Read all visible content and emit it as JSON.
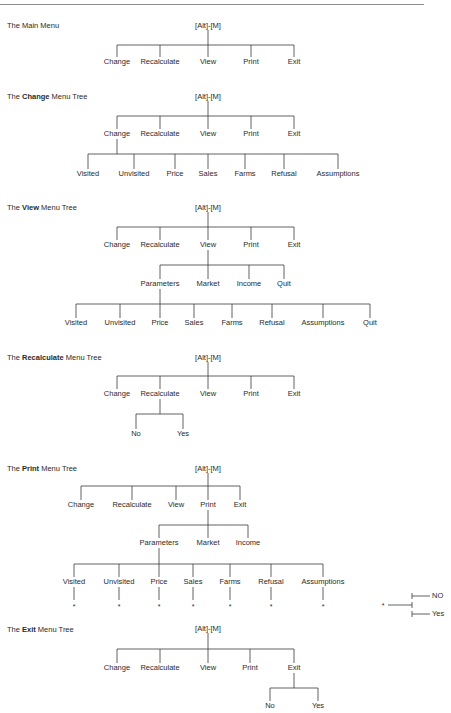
{
  "root_label": "[Alt]-[M]",
  "trees": [
    {
      "id": "main",
      "title_prefix": "The ",
      "title_bold": "",
      "title_plain": "Main Menu",
      "title_y": 26,
      "root": {
        "x": 208,
        "y": 26
      },
      "levels": [
        {
          "bar_y": 45,
          "label_y": 62,
          "parent_x": 208,
          "parent_y": 30,
          "items": [
            {
              "label": "Change",
              "x": 117
            },
            {
              "label": "Recalculate",
              "x": 160
            },
            {
              "label": "View",
              "x": 208
            },
            {
              "label": "Print",
              "x": 251
            },
            {
              "label": "Exit",
              "x": 294
            }
          ]
        }
      ]
    },
    {
      "id": "change",
      "title_prefix": "The ",
      "title_bold": "Change",
      "title_plain": " Menu Tree",
      "title_y": 97,
      "root": {
        "x": 208,
        "y": 97
      },
      "levels": [
        {
          "bar_y": 116,
          "label_y": 134,
          "parent_x": 208,
          "parent_y": 101,
          "items": [
            {
              "label": "Change",
              "x": 117
            },
            {
              "label": "Recalculate",
              "x": 160
            },
            {
              "label": "View",
              "x": 208
            },
            {
              "label": "Print",
              "x": 251
            },
            {
              "label": "Exit",
              "x": 294
            }
          ]
        },
        {
          "bar_y": 154,
          "label_y": 174,
          "parent_x": 117,
          "parent_y": 139,
          "items": [
            {
              "label": "Visited",
              "x": 88
            },
            {
              "label": "Unvisited",
              "x": 134
            },
            {
              "label": "Price",
              "x": 175
            },
            {
              "label": "Sales",
              "x": 208
            },
            {
              "label": "Farms",
              "x": 245
            },
            {
              "label": "Refusal",
              "x": 284
            },
            {
              "label": "Assumptions",
              "x": 338
            }
          ]
        }
      ]
    },
    {
      "id": "view",
      "title_prefix": "The ",
      "title_bold": "View",
      "title_plain": " Menu Tree",
      "title_y": 208,
      "root": {
        "x": 208,
        "y": 208
      },
      "levels": [
        {
          "bar_y": 227,
          "label_y": 245,
          "parent_x": 208,
          "parent_y": 212,
          "items": [
            {
              "label": "Change",
              "x": 117
            },
            {
              "label": "Recalculate",
              "x": 160
            },
            {
              "label": "View",
              "x": 208
            },
            {
              "label": "Print",
              "x": 251
            },
            {
              "label": "Exit",
              "x": 294
            }
          ]
        },
        {
          "bar_y": 265,
          "label_y": 284,
          "parent_x": 208,
          "parent_y": 250,
          "items": [
            {
              "label": "Parameters",
              "x": 160
            },
            {
              "label": "Market",
              "x": 208
            },
            {
              "label": "Income",
              "x": 249
            },
            {
              "label": "Quit",
              "x": 284
            }
          ]
        },
        {
          "bar_y": 304,
          "label_y": 323,
          "parent_x": 160,
          "parent_y": 289,
          "items": [
            {
              "label": "Visited",
              "x": 76
            },
            {
              "label": "Unvisited",
              "x": 120
            },
            {
              "label": "Price",
              "x": 160
            },
            {
              "label": "Sales",
              "x": 194
            },
            {
              "label": "Farms",
              "x": 232
            },
            {
              "label": "Refusal",
              "x": 272
            },
            {
              "label": "Assumptions",
              "x": 323
            },
            {
              "label": "Quit",
              "x": 370
            }
          ]
        }
      ]
    },
    {
      "id": "recalculate",
      "title_prefix": "The ",
      "title_bold": "Recalculate",
      "title_plain": " Menu Tree",
      "title_y": 358,
      "root": {
        "x": 208,
        "y": 358
      },
      "levels": [
        {
          "bar_y": 376,
          "label_y": 394,
          "parent_x": 208,
          "parent_y": 362,
          "items": [
            {
              "label": "Change",
              "x": 117
            },
            {
              "label": "Recalculate",
              "x": 160
            },
            {
              "label": "View",
              "x": 208
            },
            {
              "label": "Print",
              "x": 251
            },
            {
              "label": "Exit",
              "x": 294
            }
          ]
        },
        {
          "bar_y": 414,
          "label_y": 434,
          "parent_x": 160,
          "parent_y": 399,
          "items": [
            {
              "label": "No",
              "x": 136
            },
            {
              "label": "Yes",
              "x": 183
            }
          ]
        }
      ]
    },
    {
      "id": "print",
      "title_prefix": "The ",
      "title_bold": "Print",
      "title_plain": " Menu Tree",
      "title_y": 469,
      "root": {
        "x": 208,
        "y": 469
      },
      "levels": [
        {
          "bar_y": 486,
          "label_y": 505,
          "parent_x": 208,
          "parent_y": 473,
          "items": [
            {
              "label": "Change",
              "x": 81
            },
            {
              "label": "Recalculate",
              "x": 132
            },
            {
              "label": "View",
              "x": 176
            },
            {
              "label": "Print",
              "x": 208
            },
            {
              "label": "Exit",
              "x": 240
            }
          ]
        },
        {
          "bar_y": 525,
          "label_y": 543,
          "parent_x": 208,
          "parent_y": 510,
          "items": [
            {
              "label": "Parameters",
              "x": 159
            },
            {
              "label": "Market",
              "x": 208
            },
            {
              "label": "Income",
              "x": 248
            }
          ]
        },
        {
          "bar_y": 564,
          "label_y": 582,
          "parent_x": 159,
          "parent_y": 548,
          "items": [
            {
              "label": "Visited",
              "x": 74
            },
            {
              "label": "Unvisited",
              "x": 119
            },
            {
              "label": "Price",
              "x": 159
            },
            {
              "label": "Sales",
              "x": 193
            },
            {
              "label": "Farms",
              "x": 230
            },
            {
              "label": "Refusal",
              "x": 271
            },
            {
              "label": "Assumptions",
              "x": 323
            }
          ]
        }
      ],
      "stars": {
        "symbol": "*",
        "line_top": 587,
        "line_bottom": 600,
        "star_y": 606,
        "xs": [
          74,
          119,
          159,
          193,
          230,
          271,
          323
        ]
      }
    },
    {
      "id": "exit",
      "title_prefix": "The ",
      "title_bold": "Exit",
      "title_plain": " Menu Tree",
      "title_y": 630,
      "root": {
        "x": 208,
        "y": 629
      },
      "levels": [
        {
          "bar_y": 649,
          "label_y": 668,
          "parent_x": 208,
          "parent_y": 633,
          "items": [
            {
              "label": "Change",
              "x": 117
            },
            {
              "label": "Recalculate",
              "x": 160
            },
            {
              "label": "View",
              "x": 208
            },
            {
              "label": "Print",
              "x": 250
            },
            {
              "label": "Exit",
              "x": 294
            }
          ]
        },
        {
          "bar_y": 688,
          "label_y": 706,
          "parent_x": 294,
          "parent_y": 673,
          "items": [
            {
              "label": "No",
              "x": 270
            },
            {
              "label": "Yes",
              "x": 318
            }
          ]
        }
      ]
    }
  ],
  "legend": {
    "star_symbol": "*",
    "star_x": 383,
    "star_y": 605,
    "junction_x": 412,
    "no_label": "NO",
    "no_y": 596,
    "yes_label": "Yes",
    "yes_y": 614
  },
  "colors": {
    "line": "#3a3a3a",
    "text": "#2a2a2a",
    "rule": "#8a8a8a"
  }
}
